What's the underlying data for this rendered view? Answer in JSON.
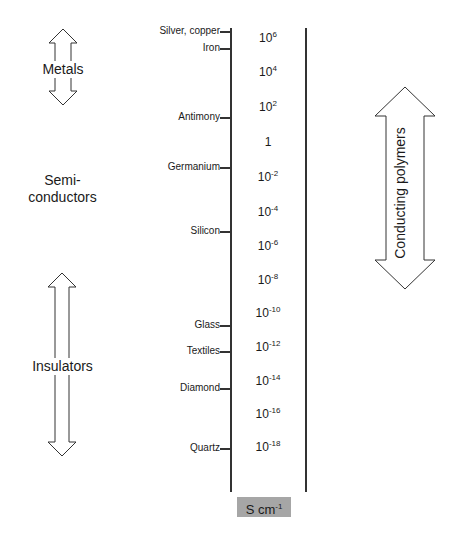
{
  "diagram": {
    "title": "",
    "unit_label": "S cm",
    "unit_exponent": "-1",
    "scale": [
      {
        "base": "10",
        "exp": "6",
        "y": 4
      },
      {
        "base": "10",
        "exp": "4",
        "y": 62
      },
      {
        "base": "10",
        "exp": "2",
        "y": 97
      },
      {
        "base": "1",
        "exp": "",
        "y": 132
      },
      {
        "base": "10",
        "exp": "-2",
        "y": 167
      },
      {
        "base": "10",
        "exp": "-4",
        "y": 202
      },
      {
        "base": "10",
        "exp": "-6",
        "y": 236
      },
      {
        "base": "10",
        "exp": "-8",
        "y": 270
      },
      {
        "base": "10",
        "exp": "-10",
        "y": 303
      },
      {
        "base": "10",
        "exp": "-12",
        "y": 337
      },
      {
        "base": "10",
        "exp": "-14",
        "y": 371
      },
      {
        "base": "10",
        "exp": "-16",
        "y": 404
      },
      {
        "base": "10",
        "exp": "-18",
        "y": 437
      }
    ],
    "materials": [
      {
        "name": "Silver, copper",
        "y": 31
      },
      {
        "name": "Iron",
        "y": 48
      },
      {
        "name": "Antimony",
        "y": 117
      },
      {
        "name": "Germanium",
        "y": 167
      },
      {
        "name": "Silicon",
        "y": 231
      },
      {
        "name": "Glass",
        "y": 325
      },
      {
        "name": "Textiles",
        "y": 351
      },
      {
        "name": "Diamond",
        "y": 388
      },
      {
        "name": "Quartz",
        "y": 448
      }
    ],
    "classes": {
      "metals": "Metals",
      "semi_line1": "Semi-",
      "semi_line2": "conductors",
      "insulators": "Insulators",
      "conducting_polymers": "Conducting polymers"
    }
  }
}
